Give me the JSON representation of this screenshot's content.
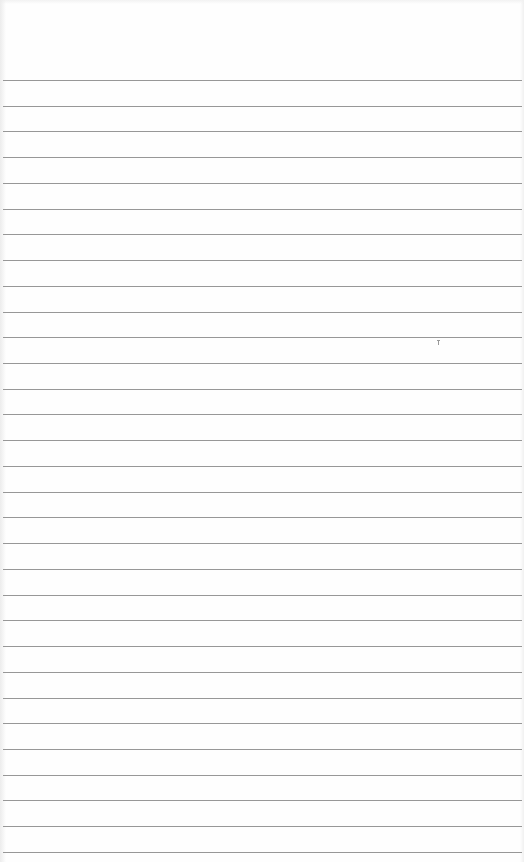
{
  "page": {
    "type": "lined-paper",
    "width": 524,
    "height": 862,
    "background_color": "#fefefe",
    "rule_color": "#8c8c8c",
    "rules": {
      "count": 31,
      "first_y": 80,
      "spacing": 25.73
    },
    "marks": [
      {
        "type": "speck",
        "x": 437,
        "y": 340
      }
    ]
  }
}
